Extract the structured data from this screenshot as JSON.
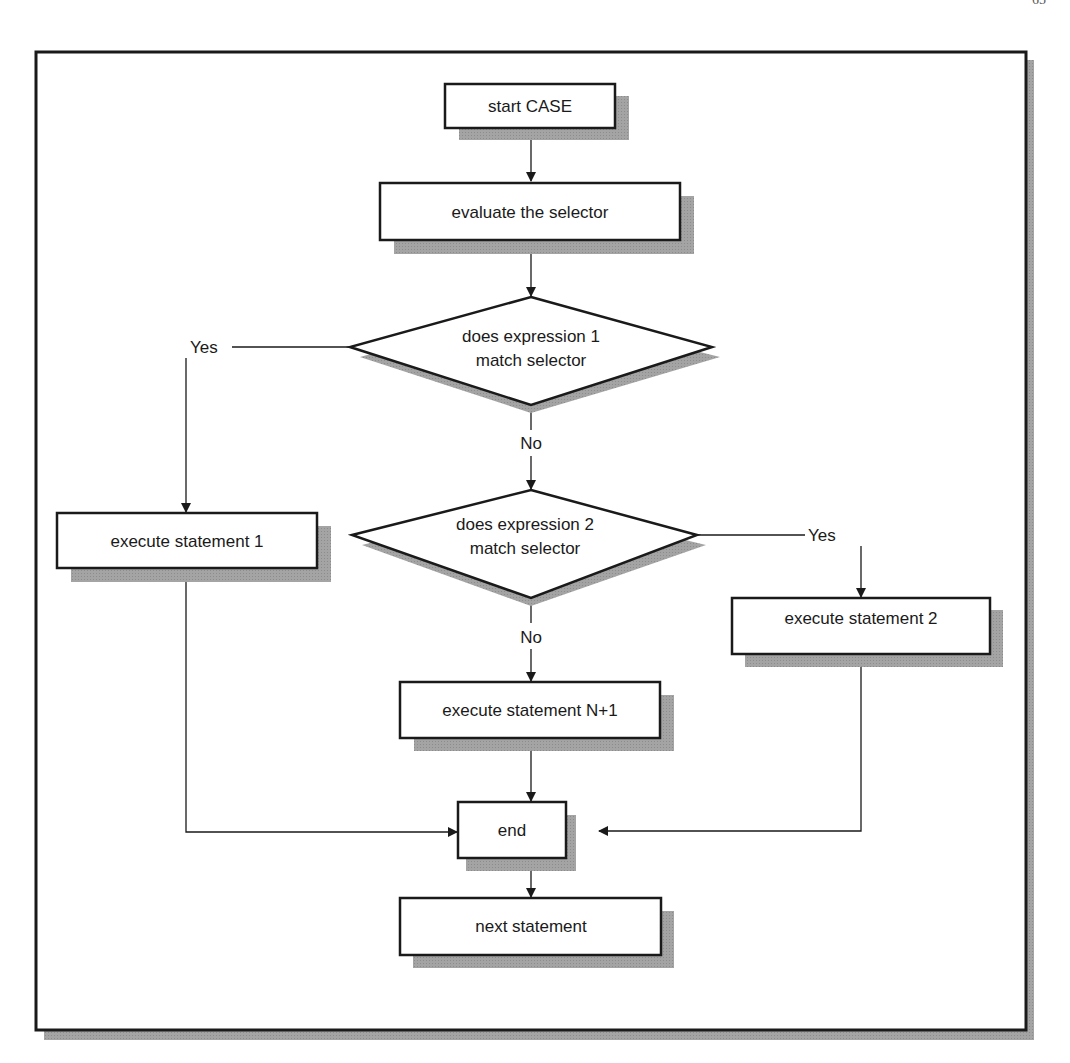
{
  "page": {
    "number": "65"
  },
  "colors": {
    "stroke": "#1a1a1a",
    "shadow": "#9a9a9a",
    "fill": "#ffffff",
    "frame_shadow": "#a8a8a8"
  },
  "flowchart": {
    "title": "CASE statement flowchart",
    "nodes": {
      "start": {
        "type": "process",
        "label": "start CASE"
      },
      "evaluate": {
        "type": "process",
        "label": "evaluate the selector"
      },
      "decision1": {
        "type": "decision",
        "line1": "does expression 1",
        "line2": "match selector"
      },
      "decision2": {
        "type": "decision",
        "line1": "does expression 2",
        "line2": "match selector"
      },
      "stmt1": {
        "type": "process",
        "label": "execute statement 1"
      },
      "stmt2": {
        "type": "process",
        "label": "execute statement 2"
      },
      "stmtN1": {
        "type": "process",
        "label": "execute statement N+1"
      },
      "end": {
        "type": "process",
        "label": "end"
      },
      "next": {
        "type": "process",
        "label": "next statement"
      }
    },
    "edge_labels": {
      "d1_yes": "Yes",
      "d1_no": "No",
      "d2_yes": "Yes",
      "d2_no": "No"
    },
    "edges": [
      {
        "from": "start",
        "to": "evaluate"
      },
      {
        "from": "evaluate",
        "to": "decision1"
      },
      {
        "from": "decision1",
        "to": "stmt1",
        "label": "Yes"
      },
      {
        "from": "decision1",
        "to": "decision2",
        "label": "No"
      },
      {
        "from": "decision2",
        "to": "stmt2",
        "label": "Yes"
      },
      {
        "from": "decision2",
        "to": "stmtN1",
        "label": "No"
      },
      {
        "from": "stmt1",
        "to": "end"
      },
      {
        "from": "stmtN1",
        "to": "end"
      },
      {
        "from": "stmt2",
        "to": "end"
      },
      {
        "from": "end",
        "to": "next"
      }
    ]
  }
}
